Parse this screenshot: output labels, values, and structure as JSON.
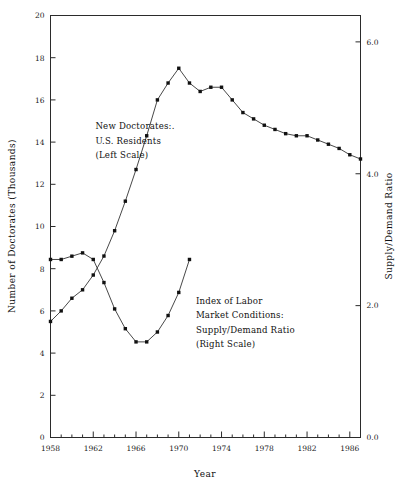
{
  "chart_data": {
    "type": "line",
    "title": "",
    "xlabel": "Year",
    "ylabel": "Number of Doctorates (Thousands)",
    "y2label": "Supply/Demand Ratio",
    "grid": false,
    "legend_position": "inline-annotations",
    "xlim": [
      1958,
      1987
    ],
    "ylim": [
      0,
      20
    ],
    "y2lim": [
      0.0,
      6.4
    ],
    "xticks": [
      1958,
      1962,
      1966,
      1970,
      1974,
      1978,
      1982,
      1986
    ],
    "xticklabels": [
      "1958",
      "1962",
      "1966",
      "1970",
      "1974",
      "1978",
      "1982",
      "1986"
    ],
    "xminorticks": [
      1959,
      1960,
      1961,
      1963,
      1964,
      1965,
      1967,
      1968,
      1969,
      1971,
      1972,
      1973,
      1975,
      1976,
      1977,
      1979,
      1980,
      1981,
      1983,
      1984,
      1985,
      1987
    ],
    "yticks": [
      0,
      2,
      4,
      6,
      8,
      10,
      12,
      14,
      16,
      18,
      20
    ],
    "yticklabels": [
      "0",
      "2",
      "4",
      "6",
      "8",
      "10",
      "12",
      "14",
      "16",
      "18",
      "20"
    ],
    "y2ticks": [
      0.0,
      2.0,
      4.0,
      6.0
    ],
    "y2ticklabels": [
      "0.0",
      "2.0",
      "4.0",
      "6.0"
    ],
    "series": [
      {
        "name": "New Doctorates: U.S. Residents",
        "axis": "left",
        "marker": "square",
        "x": [
          1958,
          1959,
          1960,
          1961,
          1962,
          1963,
          1964,
          1965,
          1966,
          1967,
          1968,
          1969,
          1970,
          1971,
          1972,
          1973,
          1974,
          1975,
          1976,
          1977,
          1978,
          1979,
          1980,
          1981,
          1982,
          1983,
          1984,
          1985,
          1986,
          1987
        ],
        "values": [
          5.5,
          6.0,
          6.6,
          7.0,
          7.7,
          8.6,
          9.8,
          11.2,
          12.7,
          14.3,
          16.0,
          16.8,
          17.5,
          16.8,
          16.4,
          16.6,
          16.6,
          16.0,
          15.4,
          15.1,
          14.8,
          14.6,
          14.4,
          14.3,
          14.3,
          14.1,
          13.9,
          13.7,
          13.4,
          13.2
        ]
      },
      {
        "name": "Index of Labor Market Conditions: Supply/Demand Ratio",
        "axis": "right",
        "marker": "square",
        "x": [
          1958,
          1959,
          1960,
          1961,
          1962,
          1963,
          1964,
          1965,
          1966,
          1967,
          1968,
          1969,
          1970,
          1971
        ],
        "values": [
          2.7,
          2.7,
          2.75,
          2.8,
          2.7,
          2.35,
          1.95,
          1.65,
          1.45,
          1.45,
          1.6,
          1.85,
          2.2,
          2.7
        ]
      }
    ],
    "annotations": [
      {
        "name": "upper-series-label",
        "lines": [
          "New Doctorates:.",
          "U.S. Residents",
          "(Left Scale)"
        ],
        "x": 1962.2,
        "y": 14.6
      },
      {
        "name": "lower-series-label",
        "lines": [
          "Index of Labor",
          "Market Conditions:",
          "Supply/Demand Ratio",
          "(Right Scale)"
        ],
        "x": 1971.6,
        "y": 6.35
      }
    ]
  }
}
